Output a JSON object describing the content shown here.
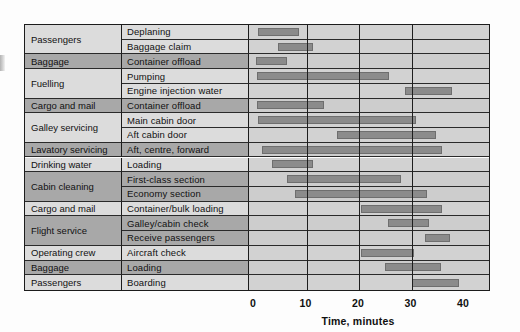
{
  "chart_data": {
    "type": "bar",
    "subtype": "gantt",
    "title": "",
    "xlabel": "Time, minutes",
    "ylabel": "",
    "xlim": [
      0,
      40
    ],
    "xticks": [
      0,
      10,
      20,
      30,
      40
    ],
    "grid": true,
    "legend": null,
    "columns": [
      "Service",
      "Task",
      "Time, minutes"
    ],
    "rows": [
      {
        "group": "Passengers",
        "task": "Deplaning",
        "start": 0.7,
        "end": 8.6,
        "band": "light"
      },
      {
        "group": "Passengers",
        "task": "Baggage claim",
        "start": 4.5,
        "end": 11.2,
        "band": "light"
      },
      {
        "group": "Baggage",
        "task": "Container offload",
        "start": 0.3,
        "end": 6.3,
        "band": "dark"
      },
      {
        "group": "Fuelling",
        "task": "Pumping",
        "start": 0.6,
        "end": 25.8,
        "band": "light"
      },
      {
        "group": "Fuelling",
        "task": "Engine injection water",
        "start": 28.7,
        "end": 37.8,
        "band": "light"
      },
      {
        "group": "Cargo and mail",
        "task": "Container offload",
        "start": 0.6,
        "end": 13.4,
        "band": "dark"
      },
      {
        "group": "Galley servicing",
        "task": "Main cabin door",
        "start": 0.7,
        "end": 30.9,
        "band": "light"
      },
      {
        "group": "Galley servicing",
        "task": "Aft cabin door",
        "start": 15.9,
        "end": 34.7,
        "band": "light"
      },
      {
        "group": "Lavatory servicing",
        "task": "Aft, centre, forward",
        "start": 1.5,
        "end": 35.9,
        "band": "dark"
      },
      {
        "group": "Drinking water",
        "task": "Loading",
        "start": 3.5,
        "end": 11.3,
        "band": "light"
      },
      {
        "group": "Cabin cleaning",
        "task": "First-class section",
        "start": 6.3,
        "end": 28.0,
        "band": "dark"
      },
      {
        "group": "Cabin cleaning",
        "task": "Economy section",
        "start": 7.9,
        "end": 33.0,
        "band": "dark"
      },
      {
        "group": "Cargo and mail",
        "task": "Container/bulk loading",
        "start": 20.3,
        "end": 35.9,
        "band": "light"
      },
      {
        "group": "Flight service",
        "task": "Galley/cabin check",
        "start": 25.6,
        "end": 33.3,
        "band": "dark"
      },
      {
        "group": "Flight service",
        "task": "Receive passengers",
        "start": 32.6,
        "end": 37.4,
        "band": "dark"
      },
      {
        "group": "Operating crew",
        "task": "Aircraft check",
        "start": 20.4,
        "end": 30.5,
        "band": "light"
      },
      {
        "group": "Baggage",
        "task": "Loading",
        "start": 25.0,
        "end": 35.7,
        "band": "dark"
      },
      {
        "group": "Passengers",
        "task": "Boarding",
        "start": 30.1,
        "end": 39.0,
        "band": "light"
      }
    ],
    "group_spans": [
      {
        "label": "Passengers",
        "from": 0,
        "to": 1,
        "band": "light"
      },
      {
        "label": "Baggage",
        "from": 2,
        "to": 2,
        "band": "dark"
      },
      {
        "label": "Fuelling",
        "from": 3,
        "to": 4,
        "band": "light"
      },
      {
        "label": "Cargo and mail",
        "from": 5,
        "to": 5,
        "band": "dark"
      },
      {
        "label": "Galley servicing",
        "from": 6,
        "to": 7,
        "band": "light"
      },
      {
        "label": "Lavatory servicing",
        "from": 8,
        "to": 8,
        "band": "dark"
      },
      {
        "label": "Drinking water",
        "from": 9,
        "to": 9,
        "band": "light"
      },
      {
        "label": "Cabin cleaning",
        "from": 10,
        "to": 11,
        "band": "dark"
      },
      {
        "label": "Cargo and mail",
        "from": 12,
        "to": 12,
        "band": "light"
      },
      {
        "label": "Flight service",
        "from": 13,
        "to": 14,
        "band": "dark"
      },
      {
        "label": "Operating crew",
        "from": 15,
        "to": 15,
        "band": "light"
      },
      {
        "label": "Baggage",
        "from": 16,
        "to": 16,
        "band": "dark"
      },
      {
        "label": "Passengers",
        "from": 17,
        "to": 17,
        "band": "light"
      }
    ],
    "colors": {
      "bar": "#8b8b8b",
      "band_light": "#dcdcdc",
      "band_dark": "#a8a8a8",
      "plot_light": "#d2d2d2",
      "plot_dark": "#cdcdcd",
      "line": "#1c1c1c",
      "text": "#111111"
    }
  }
}
